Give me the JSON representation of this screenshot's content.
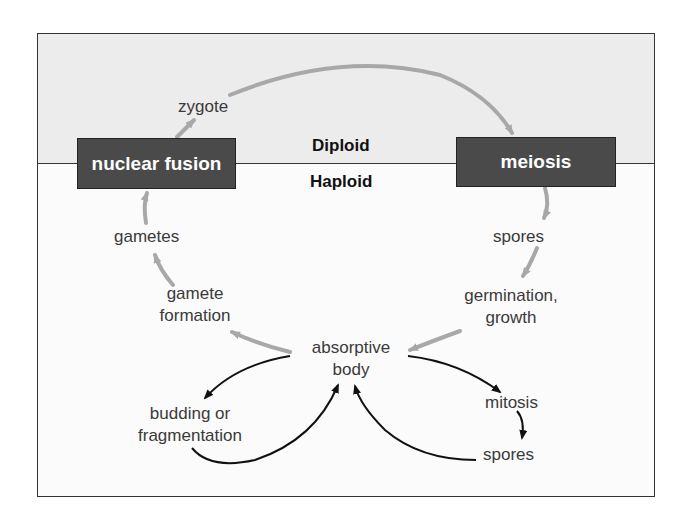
{
  "diagram": {
    "type": "life-cycle",
    "zones": {
      "upper": "Diploid",
      "lower": "Haploid"
    },
    "boxes": {
      "nuclear_fusion": "nuclear fusion",
      "meiosis": "meiosis"
    },
    "labels": {
      "zygote": "zygote",
      "spores_top": "spores",
      "germination": "germination,",
      "growth": "growth",
      "absorptive": "absorptive",
      "body": "body",
      "gamete": "gamete",
      "formation": "formation",
      "gametes": "gametes",
      "budding": "budding or",
      "fragmentation": "fragmentation",
      "mitosis": "mitosis",
      "spores_bottom": "spores"
    },
    "colors": {
      "sexual_arrow": "#a8a8a8",
      "asexual_arrow": "#111111",
      "box_fill": "#4a4a4a",
      "diploid_bg": "#ececec"
    },
    "edges": [
      {
        "from": "nuclear fusion",
        "to": "zygote",
        "style": "gray"
      },
      {
        "from": "zygote",
        "to": "meiosis",
        "style": "gray"
      },
      {
        "from": "meiosis",
        "to": "spores",
        "style": "gray"
      },
      {
        "from": "spores",
        "to": "germination, growth",
        "style": "gray"
      },
      {
        "from": "germination, growth",
        "to": "absorptive body",
        "style": "gray"
      },
      {
        "from": "absorptive body",
        "to": "gamete formation",
        "style": "gray"
      },
      {
        "from": "gamete formation",
        "to": "gametes",
        "style": "gray"
      },
      {
        "from": "gametes",
        "to": "nuclear fusion",
        "style": "gray"
      },
      {
        "from": "absorptive body",
        "to": "budding or fragmentation",
        "style": "black"
      },
      {
        "from": "budding or fragmentation",
        "to": "absorptive body",
        "style": "black"
      },
      {
        "from": "absorptive body",
        "to": "mitosis",
        "style": "black"
      },
      {
        "from": "mitosis",
        "to": "spores",
        "style": "black"
      },
      {
        "from": "spores",
        "to": "absorptive body",
        "style": "black"
      }
    ]
  }
}
